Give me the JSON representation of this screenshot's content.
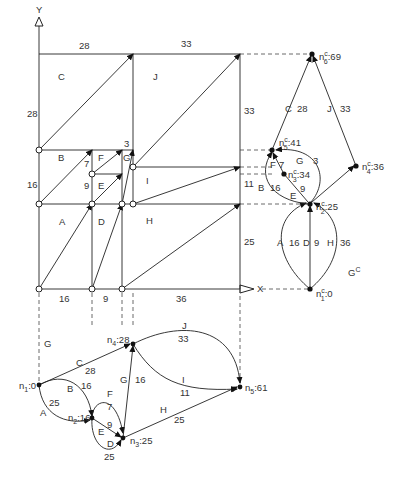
{
  "axes": {
    "x_label": "X",
    "y_label": "Y"
  },
  "top_labels": {
    "x1": "28",
    "x2": "33"
  },
  "left_labels": {
    "y_C": "28",
    "y_B": "16"
  },
  "bottom_labels": {
    "a": "16",
    "b": "9",
    "c": "36"
  },
  "right_labels": {
    "r33": "33",
    "r3": "3",
    "r11": "11",
    "r25": "25"
  },
  "inner_small": {
    "seven": "7",
    "nine": "9"
  },
  "regions": {
    "A": "A",
    "B": "B",
    "C": "C",
    "D": "D",
    "E": "E",
    "F": "F",
    "G": "G",
    "H": "H",
    "I": "I",
    "J": "J"
  },
  "graph_gc": {
    "title": "G",
    "title_sup": "C",
    "nodes": {
      "n1": {
        "label": "n",
        "sub": "1",
        "sup": "c",
        "value": ":0"
      },
      "n2": {
        "label": "n",
        "sub": "2",
        "sup": "c",
        "value": ":25"
      },
      "n3": {
        "label": "n",
        "sub": "3",
        "sup": "c",
        "value": ":34"
      },
      "n4": {
        "label": "n",
        "sub": "4",
        "sup": "c",
        "value": ":36"
      },
      "n5": {
        "label": "n",
        "sub": "5",
        "sup": "c",
        "value": ":41"
      },
      "n6": {
        "label": "n",
        "sub": "6",
        "sup": "c",
        "value": ":69"
      }
    },
    "edges": {
      "A": {
        "name": "A",
        "w": "16"
      },
      "D": {
        "name": "D",
        "w": "9"
      },
      "H": {
        "name": "H",
        "w": "36"
      },
      "B": {
        "name": "B",
        "w": "16"
      },
      "E": {
        "name": "E",
        "w": "9"
      },
      "F": {
        "name": "F",
        "w": "7"
      },
      "G": {
        "name": "G",
        "w": "3"
      },
      "C": {
        "name": "C",
        "w": "28"
      },
      "J": {
        "name": "J",
        "w": "33"
      }
    }
  },
  "graph_g": {
    "title": "G",
    "nodes": {
      "n1": {
        "label": "n",
        "sub": "1",
        "value": ":0"
      },
      "n2": {
        "label": "n",
        "sub": "2",
        "value": ":16"
      },
      "n3": {
        "label": "n",
        "sub": "3",
        "value": ":25"
      },
      "n4": {
        "label": "n",
        "sub": "4",
        "value": ":28"
      },
      "n5": {
        "label": "n",
        "sub": "5",
        "value": ":61"
      }
    },
    "edges": {
      "A": {
        "name": "A",
        "w": "25"
      },
      "B": {
        "name": "B",
        "w": "16"
      },
      "C": {
        "name": "C",
        "w": "28"
      },
      "D": {
        "name": "D",
        "w": "25"
      },
      "E": {
        "name": "E",
        "w": "9"
      },
      "F": {
        "name": "F",
        "w": "7"
      },
      "G": {
        "name": "G",
        "w": "16"
      },
      "H": {
        "name": "H",
        "w": "25"
      },
      "I": {
        "name": "I",
        "w": "11"
      },
      "J": {
        "name": "J",
        "w": "33"
      }
    }
  }
}
